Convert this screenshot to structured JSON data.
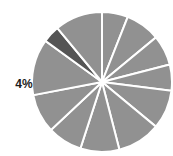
{
  "chart_data": {
    "type": "pie",
    "title": "",
    "subtitle": "",
    "xlabel": "",
    "ylabel": "",
    "grid": false,
    "legend_position": "none",
    "background_color": "#ffffff",
    "separator_color": "#ffffff",
    "separator_width": 2,
    "default_slice_color": "#919191",
    "highlight_slice_color": "#555555",
    "label_color": "#1c1c1c",
    "center": {
      "x": 102,
      "y": 82
    },
    "radius": 70,
    "start_angle_deg": -90,
    "direction": "clockwise",
    "categories": [
      "Slice 1",
      "Slice 2",
      "Slice 3",
      "Slice 4",
      "Slice 5",
      "Slice 6",
      "Slice 7",
      "Slice 8",
      "Slice 9",
      "Slice 10",
      "Slice 11",
      "Slice 12"
    ],
    "values": [
      6,
      8,
      7,
      6,
      9,
      10,
      9,
      8,
      9,
      13,
      4,
      11
    ],
    "slices": [
      {
        "name": "Slice 1",
        "value": 6,
        "color": "#919191",
        "highlight": false,
        "label": ""
      },
      {
        "name": "Slice 2",
        "value": 8,
        "color": "#919191",
        "highlight": false,
        "label": ""
      },
      {
        "name": "Slice 3",
        "value": 7,
        "color": "#919191",
        "highlight": false,
        "label": ""
      },
      {
        "name": "Slice 4",
        "value": 6,
        "color": "#919191",
        "highlight": false,
        "label": ""
      },
      {
        "name": "Slice 5",
        "value": 9,
        "color": "#919191",
        "highlight": false,
        "label": ""
      },
      {
        "name": "Slice 6",
        "value": 10,
        "color": "#919191",
        "highlight": false,
        "label": ""
      },
      {
        "name": "Slice 7",
        "value": 9,
        "color": "#919191",
        "highlight": false,
        "label": ""
      },
      {
        "name": "Slice 8",
        "value": 8,
        "color": "#919191",
        "highlight": false,
        "label": ""
      },
      {
        "name": "Slice 9",
        "value": 9,
        "color": "#919191",
        "highlight": false,
        "label": ""
      },
      {
        "name": "Slice 10",
        "value": 13,
        "color": "#919191",
        "highlight": false,
        "label": ""
      },
      {
        "name": "Slice 11",
        "value": 4,
        "color": "#555555",
        "highlight": true,
        "label": "4%"
      },
      {
        "name": "Slice 12",
        "value": 11,
        "color": "#919191",
        "highlight": false,
        "label": ""
      }
    ],
    "annotations": [
      {
        "text": "4%",
        "x": 24,
        "y": 88,
        "anchor": "middle",
        "bold": true,
        "color": "#1c1c1c"
      }
    ]
  }
}
